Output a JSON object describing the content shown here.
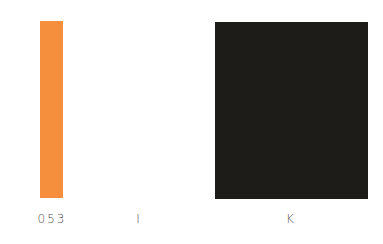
{
  "swatches": [
    {
      "label": "053",
      "color": "#f58f3e"
    },
    {
      "label": "I",
      "color": "#ffffff"
    },
    {
      "label": "K",
      "color": "#1e1c18"
    }
  ]
}
